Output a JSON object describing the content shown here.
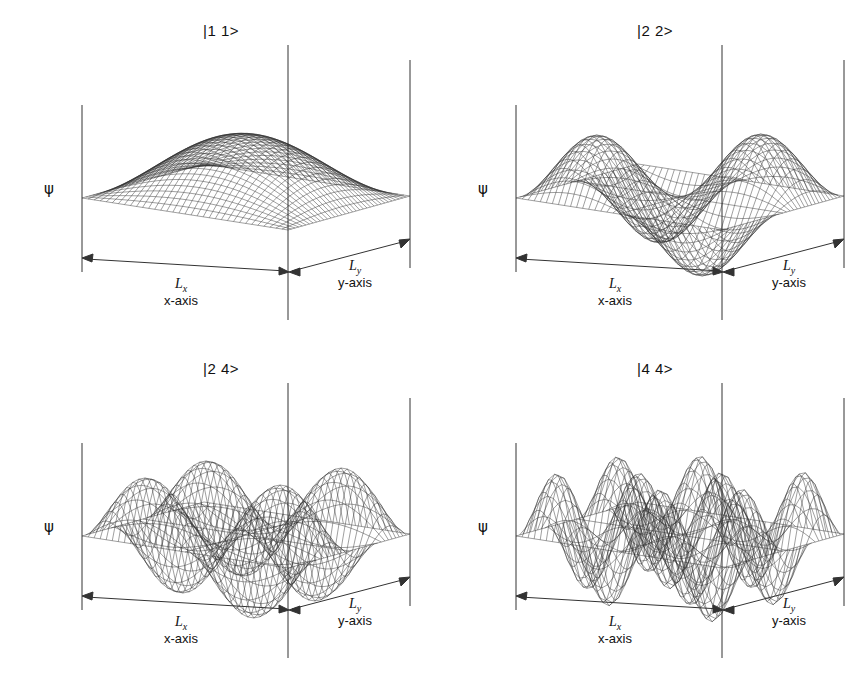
{
  "figure": {
    "background": "#ffffff",
    "ink": "#1a1a1a",
    "panel_count": 4
  },
  "axes": {
    "vertical_label": "ψ",
    "x_dim_symbol": "L",
    "x_dim_subscript": "x",
    "x_axis_label": "x-axis",
    "y_dim_symbol": "L",
    "y_dim_subscript": "y",
    "y_axis_label": "y-axis"
  },
  "panels": [
    {
      "id": "panel-11",
      "ket": "|1 1>",
      "nx": 1,
      "ny": 1,
      "psi": "ψ",
      "x_sym": "L",
      "x_sub": "x",
      "x_axis": "x-axis",
      "y_sym": "L",
      "y_sub": "y",
      "y_axis": "y-axis"
    },
    {
      "id": "panel-22",
      "ket": "|2 2>",
      "nx": 2,
      "ny": 2,
      "psi": "ψ",
      "x_sym": "L",
      "x_sub": "x",
      "x_axis": "x-axis",
      "y_sym": "L",
      "y_sub": "y",
      "y_axis": "y-axis"
    },
    {
      "id": "panel-24",
      "ket": "|2 4>",
      "nx": 2,
      "ny": 4,
      "psi": "ψ",
      "x_sym": "L",
      "x_sub": "x",
      "x_axis": "x-axis",
      "y_sym": "L",
      "y_sub": "y",
      "y_axis": "y-axis"
    },
    {
      "id": "panel-44",
      "ket": "|4 4>",
      "nx": 4,
      "ny": 4,
      "psi": "ψ",
      "x_sym": "L",
      "x_sub": "x",
      "x_axis": "x-axis",
      "y_sym": "L",
      "y_sub": "y",
      "y_axis": "y-axis"
    }
  ],
  "chart_data": {
    "type": "line",
    "subtitle": "Four quantum states shown as 3D wireframe surfaces",
    "xlabel": "x-axis (L_x)",
    "ylabel": "y-axis (L_y)",
    "zlabel": "ψ",
    "grid": false,
    "legend": "none",
    "projection": "isometric wireframe mesh",
    "formula": "psi(x,y) = sin(nx*pi*x/Lx) * sin(ny*pi*y/Ly)",
    "xlim": [
      0,
      1
    ],
    "ylim": [
      0,
      1
    ],
    "zlim": [
      -1,
      1
    ],
    "mesh_resolution": 34,
    "series": [
      {
        "name": "|1 1>",
        "nx": 1,
        "ny": 1,
        "nodes_x": 0,
        "nodes_y": 0,
        "lobes": 1,
        "peak_values": [
          1
        ],
        "description": "single broad positive hump centered in the box"
      },
      {
        "name": "|2 2>",
        "nx": 2,
        "ny": 2,
        "nodes_x": 1,
        "nodes_y": 1,
        "lobes": 4,
        "peak_values": [
          1,
          -1,
          -1,
          1
        ],
        "description": "2x2 checkerboard of alternating positive and negative lobes"
      },
      {
        "name": "|2 4>",
        "nx": 2,
        "ny": 4,
        "nodes_x": 1,
        "nodes_y": 3,
        "lobes": 8,
        "peak_values": [
          1,
          -1,
          1,
          -1,
          -1,
          1,
          -1,
          1
        ],
        "description": "2x4 array of alternating lobes, finer oscillation along y"
      },
      {
        "name": "|4 4>",
        "nx": 4,
        "ny": 4,
        "nodes_x": 3,
        "nodes_y": 3,
        "lobes": 16,
        "peak_values": [
          1,
          -1,
          1,
          -1,
          -1,
          1,
          -1,
          1,
          1,
          -1,
          1,
          -1,
          -1,
          1,
          -1,
          1
        ],
        "description": "4x4 checkerboard of alternating positive and negative lobes"
      }
    ]
  }
}
